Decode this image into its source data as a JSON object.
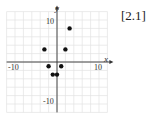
{
  "figure_label": "[2.1]",
  "chart_data": {
    "type": "scatter",
    "title": "",
    "xlabel": "x",
    "ylabel": "y",
    "xlim": [
      -12,
      12
    ],
    "ylim": [
      -12,
      12
    ],
    "grid": true,
    "x_tick_labels": [
      "-10",
      "10"
    ],
    "y_tick_labels": [
      "10",
      "-10"
    ],
    "points": [
      {
        "x": 3,
        "y": 8
      },
      {
        "x": -3,
        "y": 3
      },
      {
        "x": 2,
        "y": 3
      },
      {
        "x": -2,
        "y": -1
      },
      {
        "x": 1,
        "y": -1
      },
      {
        "x": -1,
        "y": -3
      },
      {
        "x": 0,
        "y": -3
      }
    ],
    "marker_color": "#111111"
  }
}
